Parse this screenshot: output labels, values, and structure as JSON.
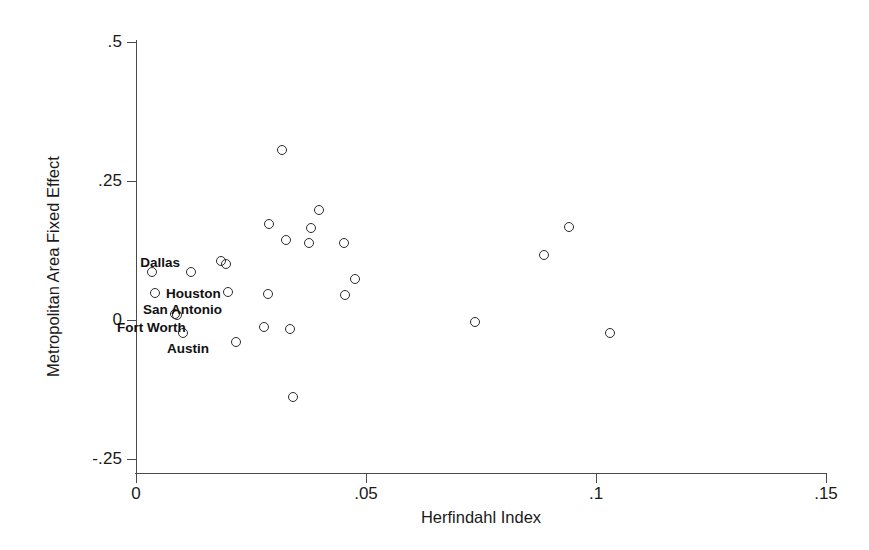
{
  "chart_data": {
    "type": "scatter",
    "title": "",
    "xlabel": "Herfindahl Index",
    "ylabel": "Metropolitan Area Fixed Effect",
    "xlim": [
      0,
      0.15
    ],
    "ylim": [
      -0.25,
      0.5
    ],
    "grid": false,
    "legend": "none",
    "xticks": [
      {
        "value": 0,
        "label": "0"
      },
      {
        "value": 0.05,
        "label": ".05"
      },
      {
        "value": 0.1,
        "label": ".1"
      },
      {
        "value": 0.15,
        "label": ".15"
      }
    ],
    "yticks": [
      {
        "value": 0.5,
        "label": ".5"
      },
      {
        "value": 0.25,
        "label": ".25"
      },
      {
        "value": 0,
        "label": "0"
      },
      {
        "value": -0.25,
        "label": "-.25"
      }
    ],
    "marker": {
      "shape": "open-circle",
      "color": "#2b2b2b",
      "size": 10
    },
    "points": [
      {
        "x": 0.0035,
        "y": 0.087,
        "label": "Dallas"
      },
      {
        "x": 0.0041,
        "y": 0.049,
        "label": "Houston"
      },
      {
        "x": 0.0089,
        "y": 0.009,
        "label": "San Antonio"
      },
      {
        "x": 0.0102,
        "y": -0.023,
        "label": "Austin"
      },
      {
        "x": 0.0085,
        "y": 0.01,
        "label": "Fort Worth"
      },
      {
        "x": 0.0119,
        "y": 0.086,
        "label": ""
      },
      {
        "x": 0.0184,
        "y": 0.106,
        "label": ""
      },
      {
        "x": 0.0195,
        "y": 0.1,
        "label": ""
      },
      {
        "x": 0.0201,
        "y": 0.05,
        "label": ""
      },
      {
        "x": 0.0286,
        "y": 0.047,
        "label": ""
      },
      {
        "x": 0.0217,
        "y": -0.04,
        "label": ""
      },
      {
        "x": 0.0318,
        "y": 0.306,
        "label": ""
      },
      {
        "x": 0.029,
        "y": 0.173,
        "label": ""
      },
      {
        "x": 0.0398,
        "y": 0.197,
        "label": ""
      },
      {
        "x": 0.0381,
        "y": 0.166,
        "label": ""
      },
      {
        "x": 0.0326,
        "y": 0.143,
        "label": ""
      },
      {
        "x": 0.0377,
        "y": 0.139,
        "label": ""
      },
      {
        "x": 0.0452,
        "y": 0.139,
        "label": ""
      },
      {
        "x": 0.0477,
        "y": 0.074,
        "label": ""
      },
      {
        "x": 0.0455,
        "y": 0.045,
        "label": ""
      },
      {
        "x": 0.0279,
        "y": -0.013,
        "label": ""
      },
      {
        "x": 0.0335,
        "y": -0.016,
        "label": ""
      },
      {
        "x": 0.0341,
        "y": -0.138,
        "label": ""
      },
      {
        "x": 0.0886,
        "y": 0.117,
        "label": ""
      },
      {
        "x": 0.0942,
        "y": 0.168,
        "label": ""
      },
      {
        "x": 0.0736,
        "y": -0.003,
        "label": ""
      },
      {
        "x": 0.1031,
        "y": -0.023,
        "label": ""
      }
    ],
    "annotations": [
      {
        "text": "Dallas",
        "side": "right",
        "px": 180,
        "py": 262
      },
      {
        "text": "Houston",
        "side": "left",
        "px": 166,
        "py": 293
      },
      {
        "text": "San Antonio",
        "side": "left",
        "px": 143,
        "py": 309
      },
      {
        "text": "Fort Worth",
        "side": "left",
        "px": 117,
        "py": 327
      },
      {
        "text": "Austin",
        "side": "left",
        "px": 167,
        "py": 348
      }
    ]
  }
}
